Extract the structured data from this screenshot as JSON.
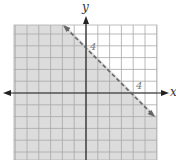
{
  "chart_data": {
    "type": "inequality-graph",
    "title": "",
    "xlabel": "x",
    "ylabel": "y",
    "xlim": [
      -6,
      6
    ],
    "ylim": [
      -5.7,
      5.8
    ],
    "grid": true,
    "grid_step": 1,
    "tick_labels": {
      "x": [
        {
          "value": 4,
          "label": "4"
        }
      ],
      "y": [
        {
          "value": 4,
          "label": "4"
        }
      ]
    },
    "boundary_line": {
      "equation": "y = -x + 4",
      "style": "dashed",
      "points": [
        [
          0,
          4
        ],
        [
          4,
          0
        ]
      ],
      "drawn_from": [
        -2,
        6
      ],
      "drawn_to": [
        5.7,
        -1.7
      ]
    },
    "inequality": "x + y < 4",
    "shaded_region": "below-left of line",
    "colors": {
      "shade": "#dcdcdc",
      "grid": "#a8a8a8",
      "axes": "#222222",
      "boundary": "#666666",
      "background": "#ffffff"
    }
  },
  "labels": {
    "x_axis": "x",
    "y_axis": "y",
    "x_tick_4": "4",
    "y_tick_4": "4"
  }
}
